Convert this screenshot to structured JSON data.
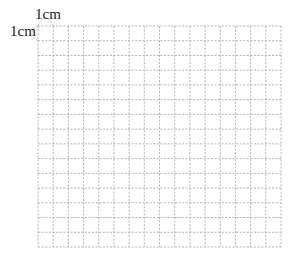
{
  "diagram": {
    "type": "grid",
    "columns": 16,
    "rows": 15,
    "cell_unit": "1cm",
    "labels": {
      "top": "1cm",
      "left": "1cm"
    },
    "colors": {
      "grid_line": "#a8a8a8",
      "label_text": "#222222",
      "background": "#ffffff"
    },
    "line_style": "dashed"
  }
}
